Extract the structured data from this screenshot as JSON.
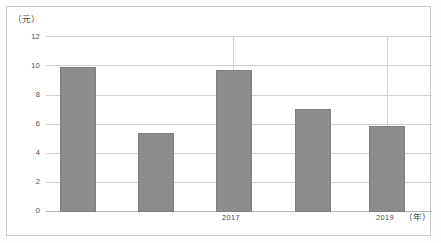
{
  "chart_data": {
    "type": "bar",
    "title": "",
    "subtitle": "",
    "xlabel": "（年）",
    "ylabel": "（元）",
    "categories": [
      "",
      "",
      "2017",
      "",
      "2019"
    ],
    "values": [
      9.9,
      5.4,
      9.7,
      7.0,
      5.9
    ],
    "ylim": [
      0,
      12
    ],
    "yticks": [
      12,
      10,
      8,
      6,
      4,
      2,
      0
    ],
    "ytick_labels": [
      "12",
      "10",
      "8",
      "6",
      "4",
      "2",
      "0"
    ],
    "xtick_labels": [
      "2017",
      "2019"
    ],
    "grid": "horizontal-and-two-vertical",
    "legend": "none",
    "series": [
      {
        "name": "价格",
        "values": [
          9.9,
          5.4,
          9.7,
          7.0,
          5.9
        ],
        "color": "#8c8c8c"
      }
    ],
    "colors": {
      "bar_fill": "#8c8c8c",
      "bar_stroke": "#7f7f7f",
      "gridline": "#d2d2d2",
      "axis": "#b4b4b4",
      "frame": "#c9c9c9",
      "text": "#4a4a4a",
      "background": "#ffffff"
    }
  },
  "axes": {
    "y_unit": "（元）",
    "x_unit": "（年）",
    "y_ticks": [
      {
        "label": "12",
        "value": 12
      },
      {
        "label": "10",
        "value": 10
      },
      {
        "label": "8",
        "value": 8
      },
      {
        "label": "6",
        "value": 6
      },
      {
        "label": "4",
        "value": 4
      },
      {
        "label": "2",
        "value": 2
      },
      {
        "label": "0",
        "value": 0
      }
    ],
    "x_ticks": [
      {
        "label": "2017"
      },
      {
        "label": "2019"
      }
    ]
  }
}
